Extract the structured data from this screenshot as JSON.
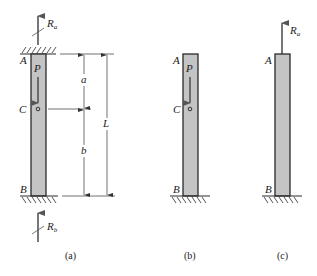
{
  "figure": {
    "panels": [
      {
        "id": "a",
        "caption": "(a)",
        "labels": {
          "top": "A",
          "load": "P",
          "mid": "C",
          "bottom": "B"
        },
        "reactions": {
          "top": {
            "symbol": "R",
            "subscript": "a"
          },
          "bottom": {
            "symbol": "R",
            "subscript": "b"
          }
        },
        "dimensions": {
          "upper": "a",
          "lower": "b",
          "total": "L"
        }
      },
      {
        "id": "b",
        "caption": "(b)",
        "labels": {
          "top": "A",
          "load": "P",
          "mid": "C",
          "bottom": "B"
        }
      },
      {
        "id": "c",
        "caption": "(c)",
        "labels": {
          "top": "A",
          "bottom": "B"
        },
        "reactions": {
          "top": {
            "symbol": "R",
            "subscript": "a"
          }
        }
      }
    ],
    "colors": {
      "bar_fill": "#c4c4c4",
      "outline": "#2a2a2a",
      "force_arrow": "#555555"
    }
  }
}
